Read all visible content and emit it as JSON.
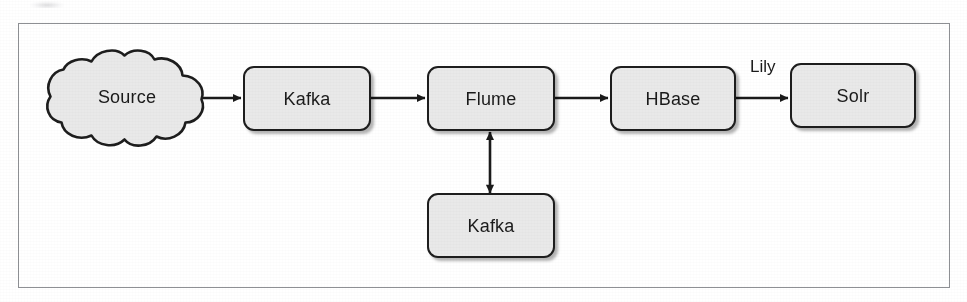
{
  "figure": {
    "type": "flow-diagram",
    "background_color": "#ffffff",
    "frame_border_color": "#8e9094",
    "node_fill_color": "#e9e9e9",
    "node_border_color": "#1d1d1d",
    "text_color": "#1a1a1a"
  },
  "nodes": [
    {
      "id": "source",
      "label": "Source",
      "shape": "cloud"
    },
    {
      "id": "kafka-top",
      "label": "Kafka",
      "shape": "rounded-rect"
    },
    {
      "id": "flume",
      "label": "Flume",
      "shape": "rounded-rect"
    },
    {
      "id": "hbase",
      "label": "HBase",
      "shape": "rounded-rect"
    },
    {
      "id": "solr",
      "label": "Solr",
      "shape": "rounded-rect"
    },
    {
      "id": "kafka-bottom",
      "label": "Kafka",
      "shape": "rounded-rect"
    }
  ],
  "edges": [
    {
      "id": "source-to-kafka",
      "from": "source",
      "to": "kafka-top",
      "label": "",
      "direction": "forward"
    },
    {
      "id": "kafka-to-flume",
      "from": "kafka-top",
      "to": "flume",
      "label": "",
      "direction": "forward"
    },
    {
      "id": "flume-to-hbase",
      "from": "flume",
      "to": "hbase",
      "label": "",
      "direction": "forward"
    },
    {
      "id": "hbase-to-solr",
      "from": "hbase",
      "to": "solr",
      "label": "Lily",
      "direction": "forward"
    },
    {
      "id": "flume-kafka-bidir",
      "from": "flume",
      "to": "kafka-bottom",
      "label": "",
      "direction": "bidirectional"
    }
  ],
  "edge_labels": {
    "hbase_to_solr": "Lily"
  }
}
